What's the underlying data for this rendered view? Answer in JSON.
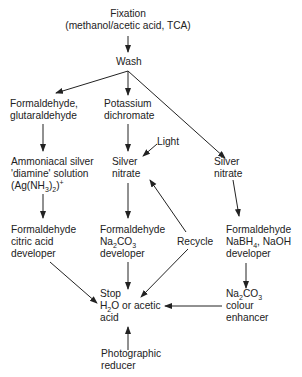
{
  "nodes": {
    "fixation": {
      "lines": [
        "Fixation",
        "(methanol/acetic acid, TCA)"
      ]
    },
    "wash": {
      "lines": [
        "Wash"
      ]
    },
    "formaldehyde_glutaraldehyde": {
      "lines": [
        "Formaldehyde,",
        "glutaraldehyde"
      ]
    },
    "potassium_dichromate": {
      "lines": [
        "Potassium",
        "dichromate"
      ]
    },
    "light": {
      "lines": [
        "Light"
      ]
    },
    "ammoniacal_silver": {
      "lines": [
        "Ammoniacal silver",
        "'diamine' solution",
        "(Ag(NH",
        "3",
        ")",
        "2",
        ")",
        "+"
      ]
    },
    "silver_nitrate_middle": {
      "lines": [
        "Silver",
        "nitrate"
      ]
    },
    "silver_nitrate_right": {
      "lines": [
        "Silver",
        "nitrate"
      ]
    },
    "citric_developer": {
      "lines": [
        "Formaldehyde",
        "citric acid",
        "developer"
      ]
    },
    "na2co3_developer": {
      "lines": [
        "Formaldehyde",
        "Na",
        "2",
        "CO",
        "3",
        "developer"
      ]
    },
    "recycle": {
      "lines": [
        "Recycle"
      ]
    },
    "nabh4_developer": {
      "lines": [
        "Formaldehyde",
        "NaBH",
        "4",
        ", NaOH",
        "developer"
      ]
    },
    "stop": {
      "lines": [
        "Stop",
        "H",
        "2",
        "O or acetic",
        "acid"
      ]
    },
    "colour_enhancer": {
      "lines": [
        "Na",
        "2",
        "CO",
        "3",
        "colour",
        "enhancer"
      ]
    },
    "photographic_reducer": {
      "lines": [
        "Photographic",
        "reducer"
      ]
    }
  },
  "colors": {
    "ink": "#222222",
    "background": "#ffffff"
  }
}
